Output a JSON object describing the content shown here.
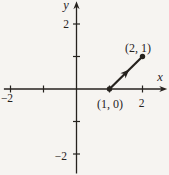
{
  "figure": {
    "background_color": "#f6f4f1",
    "ink_color": "#26221e",
    "axes": {
      "x_label": "x",
      "y_label": "y",
      "x_range": [
        -2.2,
        2.75
      ],
      "y_range": [
        -2.6,
        2.7
      ],
      "x_ticks": [
        -2,
        -1,
        1,
        2
      ],
      "y_ticks": [
        -2,
        -1,
        1,
        2
      ],
      "x_tick_labels": [
        {
          "value": -2,
          "text": "−2"
        },
        {
          "value": 2,
          "text": "2"
        }
      ],
      "y_tick_labels": [
        {
          "value": 2,
          "text": "2"
        },
        {
          "value": -2,
          "text": "−2"
        }
      ]
    },
    "vector": {
      "from": [
        1,
        0
      ],
      "to": [
        2,
        1
      ]
    },
    "points": [
      {
        "coords": [
          1,
          0
        ],
        "label": "(1, 0)",
        "label_placement": "below"
      },
      {
        "coords": [
          2,
          1
        ],
        "label": "(2, 1)",
        "label_placement": "above"
      }
    ]
  }
}
